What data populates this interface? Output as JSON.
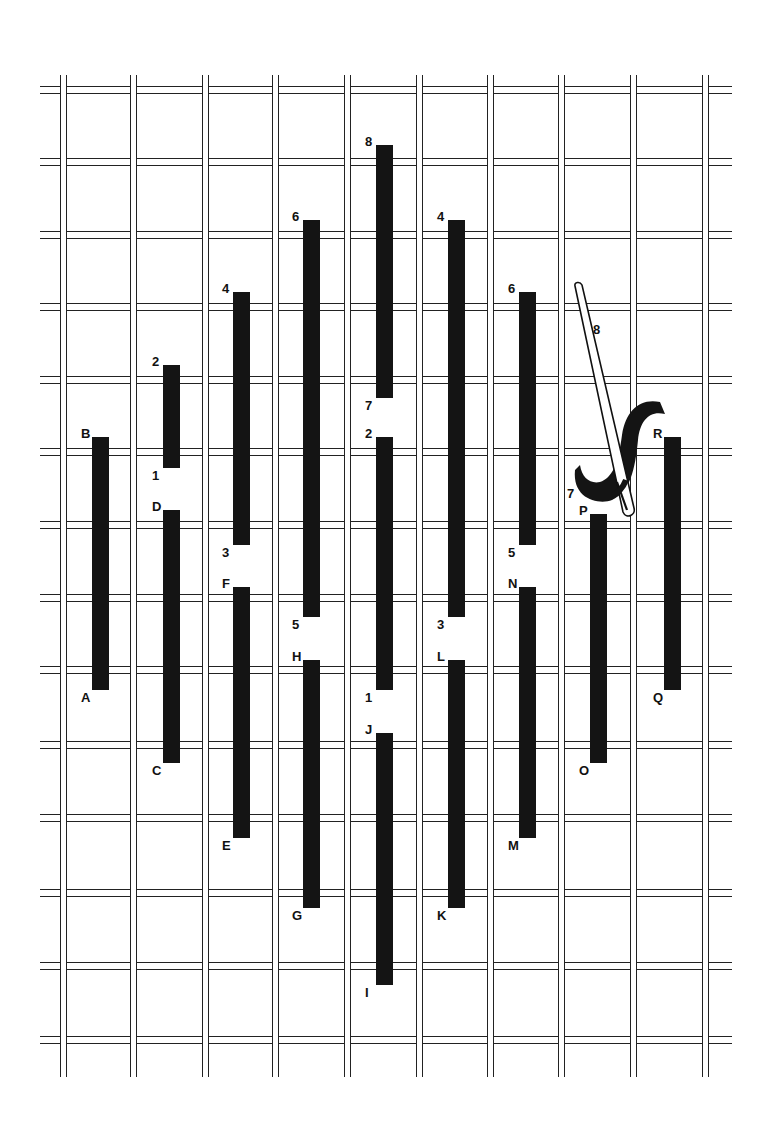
{
  "diagram": {
    "type": "needlepoint-stitch-diagram",
    "grid": {
      "vertical_lines_x": [
        63,
        133,
        205,
        275,
        347,
        419,
        490,
        561,
        633,
        705
      ],
      "horizontal_lines_y": [
        90,
        162,
        235,
        307,
        380,
        452,
        525,
        598,
        670,
        745,
        818,
        893,
        966,
        1040
      ],
      "top": 75,
      "bottom": 1077,
      "left": 40,
      "right": 732
    },
    "stitches": [
      {
        "x": 92,
        "top": 437,
        "bottom": 690,
        "top_label": "B",
        "bottom_label": "A"
      },
      {
        "x": 163,
        "top": 365,
        "bottom": 468,
        "top_label": "2",
        "bottom_label": "1"
      },
      {
        "x": 163,
        "top": 510,
        "bottom": 763,
        "top_label": "D",
        "bottom_label": "C"
      },
      {
        "x": 233,
        "top": 292,
        "bottom": 545,
        "top_label": "4",
        "bottom_label": "3"
      },
      {
        "x": 233,
        "top": 587,
        "bottom": 838,
        "top_label": "F",
        "bottom_label": "E"
      },
      {
        "x": 303,
        "top": 220,
        "bottom": 617,
        "top_label": "6",
        "bottom_label": "5"
      },
      {
        "x": 303,
        "top": 660,
        "bottom": 908,
        "top_label": "H",
        "bottom_label": "G"
      },
      {
        "x": 376,
        "top": 145,
        "bottom": 398,
        "top_label": "8",
        "bottom_label": "7"
      },
      {
        "x": 376,
        "top": 437,
        "bottom": 690,
        "top_label": "2",
        "bottom_label": "1"
      },
      {
        "x": 376,
        "top": 733,
        "bottom": 985,
        "top_label": "J",
        "bottom_label": "I"
      },
      {
        "x": 448,
        "top": 220,
        "bottom": 617,
        "top_label": "4",
        "bottom_label": "3"
      },
      {
        "x": 448,
        "top": 660,
        "bottom": 908,
        "top_label": "L",
        "bottom_label": "K"
      },
      {
        "x": 519,
        "top": 292,
        "bottom": 545,
        "top_label": "6",
        "bottom_label": "5"
      },
      {
        "x": 519,
        "top": 587,
        "bottom": 838,
        "top_label": "N",
        "bottom_label": "M"
      },
      {
        "x": 590,
        "top": 514,
        "bottom": 763,
        "top_label": "P",
        "bottom_label": "O"
      },
      {
        "x": 664,
        "top": 437,
        "bottom": 690,
        "top_label": "R",
        "bottom_label": "Q"
      }
    ],
    "needle": {
      "labels": [
        "8",
        "7"
      ]
    },
    "colors": {
      "stitch": "#141414",
      "grid": "#222222",
      "background": "#ffffff"
    }
  }
}
